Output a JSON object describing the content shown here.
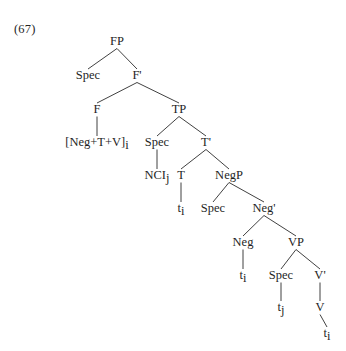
{
  "figure": {
    "example_number": "(67)",
    "caption": "",
    "background_color": "#ffffff",
    "line_color": "#2b2b2b",
    "text_color": "#1f1f1f"
  },
  "tree": {
    "type": "syntax-tree",
    "nodes": [
      {
        "id": "FP",
        "label": "FP",
        "x": 117,
        "y": 45
      },
      {
        "id": "Spec_FP",
        "label": "Spec",
        "x": 88,
        "y": 79
      },
      {
        "id": "Fbar",
        "label": "F'",
        "x": 137,
        "y": 79
      },
      {
        "id": "F",
        "label": "F",
        "x": 97,
        "y": 113
      },
      {
        "id": "TP",
        "label": "TP",
        "x": 179,
        "y": 113
      },
      {
        "id": "Head_F",
        "label": "[Neg+T+V]i",
        "x": 97,
        "y": 146
      },
      {
        "id": "Spec_TP",
        "label": "Spec",
        "x": 157,
        "y": 146
      },
      {
        "id": "Tbar",
        "label": "T'",
        "x": 206,
        "y": 146
      },
      {
        "id": "NCl",
        "label": "NCIj",
        "x": 157,
        "y": 179
      },
      {
        "id": "T",
        "label": "T",
        "x": 181,
        "y": 179
      },
      {
        "id": "NegP",
        "label": "NegP",
        "x": 229,
        "y": 179
      },
      {
        "id": "trace_T",
        "label": "ti",
        "x": 181,
        "y": 212
      },
      {
        "id": "Spec_NegP",
        "label": "Spec",
        "x": 213,
        "y": 212
      },
      {
        "id": "Negbar",
        "label": "Neg'",
        "x": 264,
        "y": 212
      },
      {
        "id": "Neg",
        "label": "Neg",
        "x": 243,
        "y": 246
      },
      {
        "id": "VP",
        "label": "VP",
        "x": 296,
        "y": 246
      },
      {
        "id": "trace_Neg",
        "label": "ti",
        "x": 243,
        "y": 279
      },
      {
        "id": "Spec_VP",
        "label": "Spec",
        "x": 281,
        "y": 279
      },
      {
        "id": "Vbar",
        "label": "V'",
        "x": 320,
        "y": 279
      },
      {
        "id": "trace_j",
        "label": "tj",
        "x": 281,
        "y": 311
      },
      {
        "id": "V",
        "label": "V",
        "x": 320,
        "y": 311
      },
      {
        "id": "trace_V",
        "label": "ti",
        "x": 327,
        "y": 337
      }
    ],
    "edges": [
      {
        "from": "FP",
        "to": "Spec_FP"
      },
      {
        "from": "FP",
        "to": "Fbar"
      },
      {
        "from": "Fbar",
        "to": "F"
      },
      {
        "from": "Fbar",
        "to": "TP"
      },
      {
        "from": "F",
        "to": "Head_F"
      },
      {
        "from": "TP",
        "to": "Spec_TP"
      },
      {
        "from": "TP",
        "to": "Tbar"
      },
      {
        "from": "Spec_TP",
        "to": "NCl"
      },
      {
        "from": "Tbar",
        "to": "T"
      },
      {
        "from": "Tbar",
        "to": "NegP"
      },
      {
        "from": "T",
        "to": "trace_T"
      },
      {
        "from": "NegP",
        "to": "Spec_NegP"
      },
      {
        "from": "NegP",
        "to": "Negbar"
      },
      {
        "from": "Negbar",
        "to": "Neg"
      },
      {
        "from": "Negbar",
        "to": "VP"
      },
      {
        "from": "Neg",
        "to": "trace_Neg"
      },
      {
        "from": "VP",
        "to": "Spec_VP"
      },
      {
        "from": "VP",
        "to": "Vbar"
      },
      {
        "from": "Spec_VP",
        "to": "trace_j"
      },
      {
        "from": "Vbar",
        "to": "V"
      },
      {
        "from": "V",
        "to": "trace_V"
      }
    ]
  }
}
